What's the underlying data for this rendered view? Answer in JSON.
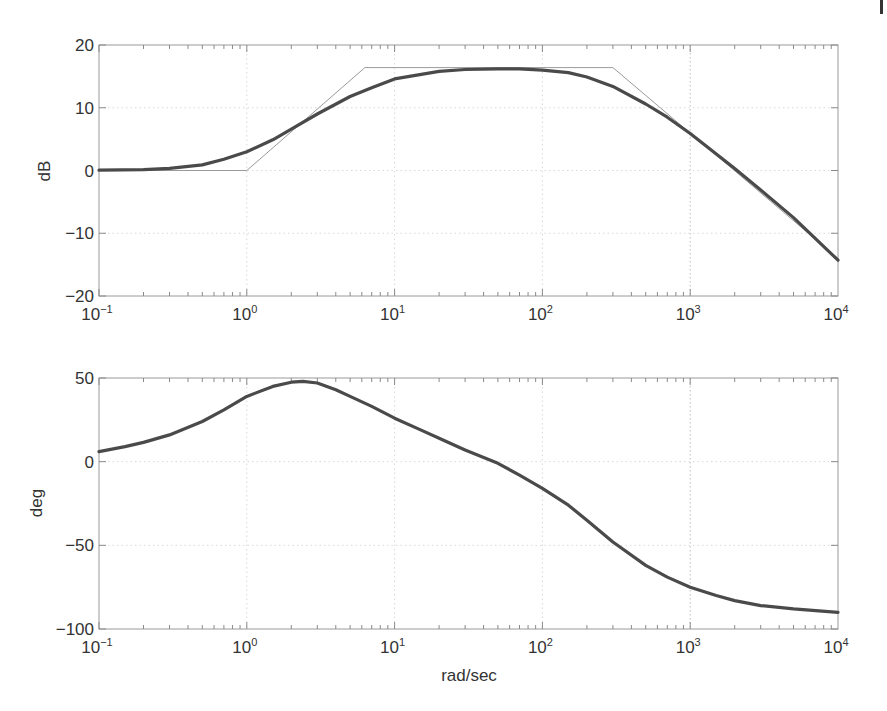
{
  "chart_data": [
    {
      "type": "line",
      "title": "",
      "xlabel": "",
      "ylabel": "dB",
      "xscale": "log",
      "xlim": [
        0.1,
        10000
      ],
      "ylim": [
        -20,
        20
      ],
      "grid": true,
      "x_tick_labels": [
        {
          "base": "10",
          "exp": "−1",
          "value": 0.1
        },
        {
          "base": "10",
          "exp": "0",
          "value": 1
        },
        {
          "base": "10",
          "exp": "1",
          "value": 10
        },
        {
          "base": "10",
          "exp": "2",
          "value": 100
        },
        {
          "base": "10",
          "exp": "3",
          "value": 1000
        },
        {
          "base": "10",
          "exp": "4",
          "value": 10000
        }
      ],
      "y_ticks": [
        20,
        10,
        0,
        -10,
        -20
      ],
      "y_tick_labels": [
        "20",
        "10",
        "0",
        "−10",
        "−20"
      ],
      "series": [
        {
          "name": "magnitude",
          "style": "thick-dark",
          "x": [
            0.1,
            0.2,
            0.3,
            0.5,
            0.7,
            1,
            1.5,
            2,
            3,
            5,
            7,
            10,
            20,
            30,
            50,
            70,
            100,
            150,
            200,
            300,
            500,
            700,
            1000,
            2000,
            3000,
            5000,
            10000
          ],
          "y": [
            0.05,
            0.15,
            0.35,
            0.9,
            1.8,
            3.0,
            4.9,
            6.6,
            9.0,
            11.8,
            13.2,
            14.6,
            15.8,
            16.1,
            16.2,
            16.2,
            16.0,
            15.6,
            14.9,
            13.4,
            10.6,
            8.5,
            5.9,
            0.3,
            -3.1,
            -7.5,
            -14.3
          ]
        },
        {
          "name": "asymptote",
          "style": "thin-gray",
          "x": [
            0.1,
            1,
            6.3,
            300,
            10000
          ],
          "y": [
            0,
            0,
            16.4,
            16.4,
            -14.0
          ]
        }
      ]
    },
    {
      "type": "line",
      "title": "",
      "xlabel": "rad/sec",
      "ylabel": "deg",
      "xscale": "log",
      "xlim": [
        0.1,
        10000
      ],
      "ylim": [
        -100,
        50
      ],
      "grid": true,
      "x_tick_labels": [
        {
          "base": "10",
          "exp": "−1",
          "value": 0.1
        },
        {
          "base": "10",
          "exp": "0",
          "value": 1
        },
        {
          "base": "10",
          "exp": "1",
          "value": 10
        },
        {
          "base": "10",
          "exp": "2",
          "value": 100
        },
        {
          "base": "10",
          "exp": "3",
          "value": 1000
        },
        {
          "base": "10",
          "exp": "4",
          "value": 10000
        }
      ],
      "y_ticks": [
        50,
        0,
        -50,
        -100
      ],
      "y_tick_labels": [
        "50",
        "0",
        "−50",
        "−100"
      ],
      "series": [
        {
          "name": "phase",
          "style": "thick-dark",
          "x": [
            0.1,
            0.15,
            0.2,
            0.3,
            0.5,
            0.7,
            1,
            1.5,
            2,
            2.4,
            3,
            4,
            5,
            7,
            10,
            15,
            20,
            30,
            50,
            70,
            100,
            150,
            200,
            300,
            500,
            700,
            1000,
            1500,
            2000,
            3000,
            5000,
            10000
          ],
          "y": [
            6,
            9,
            11.5,
            16,
            24,
            31,
            39,
            45,
            47.5,
            48,
            47,
            43,
            39,
            33,
            26,
            19,
            14,
            7,
            -1,
            -8,
            -16,
            -26,
            -35,
            -48,
            -62,
            -69,
            -75,
            -80,
            -83,
            -86,
            -88,
            -90
          ]
        }
      ]
    }
  ],
  "axes": {
    "top": {
      "ylabel": "dB"
    },
    "bottom": {
      "ylabel": "deg",
      "xlabel": "rad/sec"
    }
  }
}
